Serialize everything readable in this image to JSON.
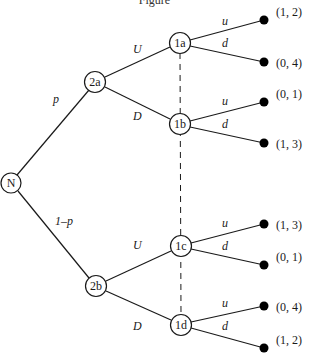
{
  "title": "Figure",
  "colors": {
    "line": "#1a1a1a",
    "node_fill": "#ffffff",
    "terminal": "#000000",
    "background": "#ffffff"
  },
  "nodes": {
    "N": {
      "label": "N",
      "x": 11,
      "y": 183
    },
    "2a": {
      "label": "2a",
      "x": 95,
      "y": 82
    },
    "2b": {
      "label": "2b",
      "x": 96,
      "y": 286
    },
    "1a": {
      "label": "1a",
      "x": 180,
      "y": 43
    },
    "1b": {
      "label": "1b",
      "x": 180,
      "y": 124
    },
    "1c": {
      "label": "1c",
      "x": 181,
      "y": 246
    },
    "1d": {
      "label": "1d",
      "x": 181,
      "y": 325
    }
  },
  "edges": {
    "p": {
      "label": "p"
    },
    "1mp": {
      "label": "1–p"
    },
    "aU": {
      "label": "U"
    },
    "aD": {
      "label": "D"
    },
    "bU": {
      "label": "U"
    },
    "bD": {
      "label": "D"
    },
    "u": "u",
    "d": "d"
  },
  "payoffs": {
    "t1": "(1, 2)",
    "t2": "(0, 4)",
    "t3": "(0, 1)",
    "t4": "(1, 3)",
    "t5": "(1, 3)",
    "t6": "(0, 1)",
    "t7": "(0, 4)",
    "t8": "(1, 2)"
  },
  "information_sets": [
    {
      "members": [
        "1a",
        "1b",
        "1c",
        "1d"
      ],
      "style": "dashed"
    }
  ]
}
